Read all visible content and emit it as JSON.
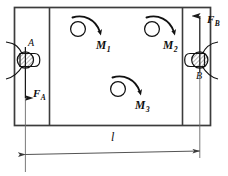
{
  "figure": {
    "type": "engineering-shaft-torque-diagram",
    "stroke_color": "#1a1a1a",
    "thin_stroke_color": "#555555",
    "background": "#ffffff"
  },
  "labels": {
    "bearing_a": "A",
    "bearing_b": "B",
    "force_a": {
      "symbol": "F",
      "subscript": "A"
    },
    "force_b": {
      "symbol": "F",
      "subscript": "B"
    },
    "torque_1": {
      "symbol": "M",
      "subscript": "1"
    },
    "torque_2": {
      "symbol": "M",
      "subscript": "2"
    },
    "torque_3": {
      "symbol": "M",
      "subscript": "3"
    },
    "dimension_length": "l"
  },
  "elements": {
    "shaft_body": "rectangle",
    "left_partition": "vertical-line",
    "right_partition": "vertical-line",
    "bearing_a_symbol": "hatched-circle-in-housing",
    "bearing_b_symbol": "hatched-circle-in-housing",
    "force_a_direction": "down",
    "force_b_direction": "up",
    "torque_1_direction": "clockwise-arc",
    "torque_2_direction": "clockwise-arc",
    "torque_3_direction": "clockwise-arc",
    "dimension_line": "double-headed-arrow"
  }
}
